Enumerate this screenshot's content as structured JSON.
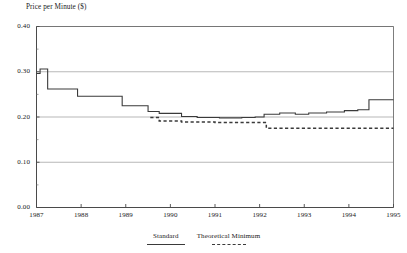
{
  "chart_data": {
    "type": "line",
    "title": "Price per Minute ($)",
    "xlabel": "",
    "ylabel": "Price per Minute ($)",
    "ylim": [
      0.0,
      0.4
    ],
    "xlim": [
      1987,
      1995
    ],
    "grid": true,
    "step_style": "post",
    "y_ticks": [
      "0.00",
      "0.10",
      "0.20",
      "0.30",
      "0.40"
    ],
    "y_tick_values": [
      0.0,
      0.1,
      0.2,
      0.3,
      0.4
    ],
    "x_ticks": [
      "1987",
      "1988",
      "1989",
      "1990",
      "1991",
      "1992",
      "1993",
      "1994",
      "1995"
    ],
    "x_tick_values": [
      1987,
      1988,
      1989,
      1990,
      1991,
      1992,
      1993,
      1994,
      1995
    ],
    "legend_position": "bottom-center",
    "series": [
      {
        "name": "Standard",
        "style": "solid",
        "color": "#3a3a3a",
        "x": [
          1987.0,
          1987.08,
          1987.25,
          1987.92,
          1988.92,
          1989.5,
          1989.75,
          1990.25,
          1990.6,
          1991.1,
          1991.6,
          1991.9,
          1992.1,
          1992.45,
          1992.8,
          1993.1,
          1993.5,
          1993.9,
          1994.2,
          1994.45,
          1995.0
        ],
        "y": [
          0.296,
          0.306,
          0.262,
          0.246,
          0.225,
          0.212,
          0.208,
          0.201,
          0.199,
          0.198,
          0.199,
          0.2,
          0.206,
          0.209,
          0.206,
          0.209,
          0.211,
          0.214,
          0.216,
          0.238,
          0.238
        ]
      },
      {
        "name": "Theoretical Minimum",
        "style": "dashed",
        "color": "#3a3a3a",
        "x": [
          1989.55,
          1989.75,
          1990.25,
          1991.0,
          1991.8,
          1992.05,
          1992.15,
          1993.0,
          1994.0,
          1995.0
        ],
        "y": [
          0.199,
          0.191,
          0.189,
          0.188,
          0.188,
          0.188,
          0.175,
          0.175,
          0.175,
          0.175
        ]
      }
    ]
  },
  "legend": {
    "items": [
      {
        "label": "Standard",
        "style": "solid"
      },
      {
        "label": "Theoretical Minimum",
        "style": "dashed"
      }
    ]
  }
}
